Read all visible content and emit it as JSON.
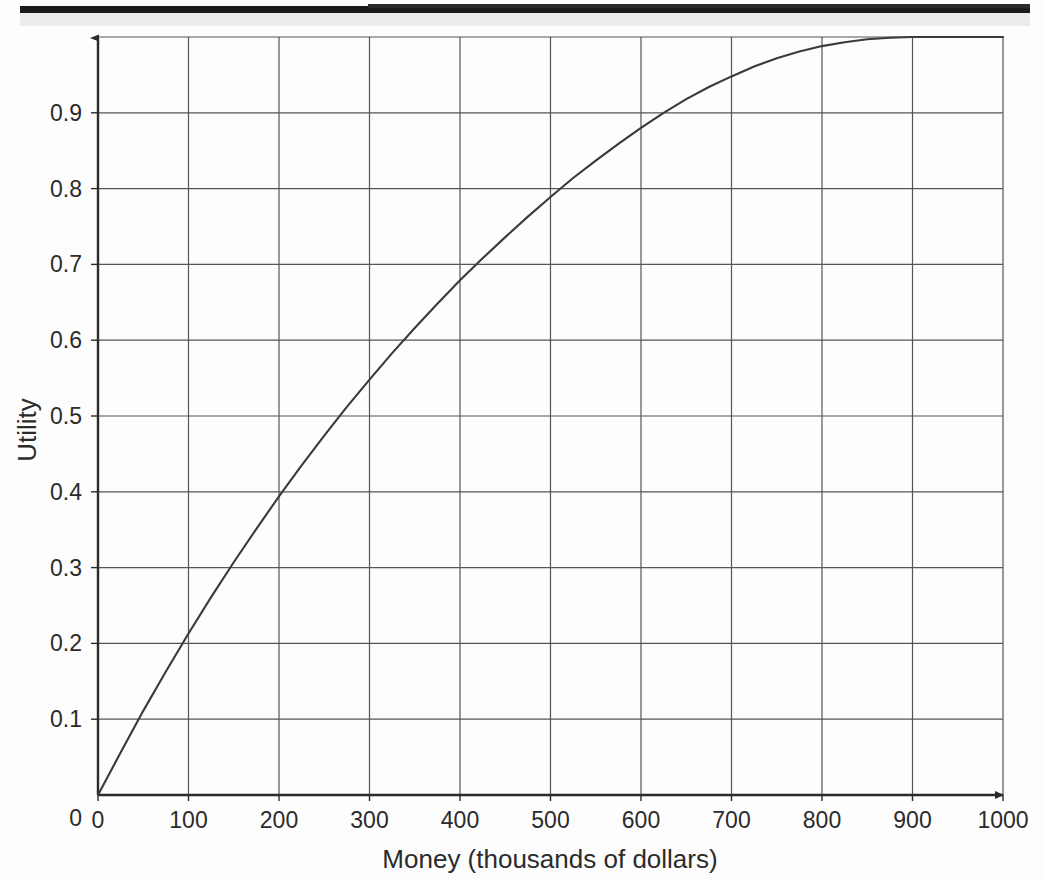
{
  "page": {
    "background_color": "#fdfdfd",
    "scan_artifact_color": "#1b1b1b"
  },
  "chart_data": {
    "type": "line",
    "title": "",
    "subtitle": "",
    "xlabel": "Money (thousands of dollars)",
    "ylabel": "Utility",
    "xlim": [
      0,
      1000
    ],
    "ylim": [
      0,
      1.0
    ],
    "grid": true,
    "legend": null,
    "line_color": "#3a3a3a",
    "axis_color": "#2b2b2b",
    "grid_color": "#555555",
    "xticks": [
      0,
      100,
      200,
      300,
      400,
      500,
      600,
      700,
      800,
      900,
      1000
    ],
    "xtick_labels": [
      "0",
      "100",
      "200",
      "300",
      "400",
      "500",
      "600",
      "700",
      "800",
      "900",
      "1000"
    ],
    "yticks": [
      0,
      0.1,
      0.2,
      0.3,
      0.4,
      0.5,
      0.6,
      0.7,
      0.8,
      0.9
    ],
    "ytick_labels": [
      "0",
      "0.1",
      "0.2",
      "0.3",
      "0.4",
      "0.5",
      "0.6",
      "0.7",
      "0.8",
      "0.9"
    ],
    "series": [
      {
        "name": "Utility of money",
        "x": [
          0,
          25,
          50,
          75,
          100,
          125,
          150,
          175,
          200,
          225,
          250,
          275,
          300,
          325,
          350,
          375,
          400,
          425,
          450,
          475,
          500,
          525,
          550,
          575,
          600,
          625,
          650,
          675,
          700,
          725,
          750,
          775,
          800,
          825,
          850,
          875,
          900,
          925,
          950,
          975,
          1000
        ],
        "y": [
          0.0,
          0.056,
          0.111,
          0.163,
          0.213,
          0.261,
          0.307,
          0.351,
          0.394,
          0.435,
          0.474,
          0.512,
          0.548,
          0.583,
          0.616,
          0.648,
          0.679,
          0.708,
          0.736,
          0.763,
          0.789,
          0.814,
          0.837,
          0.859,
          0.88,
          0.9,
          0.918,
          0.934,
          0.948,
          0.961,
          0.972,
          0.981,
          0.988,
          0.993,
          0.997,
          0.999,
          1.0,
          1.0,
          1.0,
          1.0,
          1.0
        ]
      }
    ],
    "annotations": [
      {
        "label": "curve passes 0.2 near x=100"
      },
      {
        "label": "curve passes 0.8 near x=600"
      },
      {
        "label": "curve passes 0.9 near x=750"
      }
    ]
  },
  "axis_arrows": {
    "y_arrow": "up-arrow",
    "x_arrow": "right-arrow"
  }
}
